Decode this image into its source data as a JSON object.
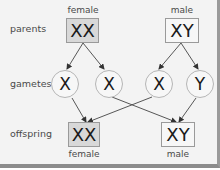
{
  "diagram": {
    "row_labels": {
      "parents": "parents",
      "gametes": "gametes",
      "offspring": "offspring"
    },
    "parents": [
      {
        "sex": "female",
        "genotype": "XX",
        "fill": "#d8d8d8"
      },
      {
        "sex": "male",
        "genotype": "XY",
        "fill": "#f7f7f7"
      }
    ],
    "gametes": [
      {
        "allele": "X",
        "from": "female"
      },
      {
        "allele": "X",
        "from": "female"
      },
      {
        "allele": "X",
        "from": "male"
      },
      {
        "allele": "Y",
        "from": "male"
      }
    ],
    "offspring": [
      {
        "sex": "female",
        "genotype": "XX",
        "fill": "#d8d8d8"
      },
      {
        "sex": "male",
        "genotype": "XY",
        "fill": "#f7f7f7"
      }
    ],
    "connections": [
      "female parent -> gamete X (1)",
      "female parent -> gamete X (2)",
      "male parent -> gamete X (3)",
      "male parent -> gamete Y (4)",
      "gamete X (1) -> offspring female XX",
      "gamete X (3) -> offspring female XX",
      "gamete X (2) -> offspring male XY",
      "gamete Y (4) -> offspring male XY"
    ]
  }
}
